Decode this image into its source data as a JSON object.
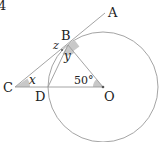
{
  "question_number": "4",
  "points": {
    "A": {
      "label": "A",
      "x": 105,
      "y": 13
    },
    "B": {
      "label": "B",
      "x": 68,
      "y": 45
    },
    "C": {
      "label": "C",
      "x": 15,
      "y": 87
    },
    "D": {
      "label": "D",
      "x": 48,
      "y": 87
    },
    "O": {
      "label": "O",
      "x": 103,
      "y": 87
    }
  },
  "circle": {
    "cx": 103,
    "cy": 87,
    "r": 55
  },
  "angles": {
    "x": "x",
    "y": "y",
    "z": "z",
    "angle_O": "50°"
  },
  "colors": {
    "line": "#9a9a9a",
    "shade": "#c8c8c8",
    "text": "#222222"
  }
}
